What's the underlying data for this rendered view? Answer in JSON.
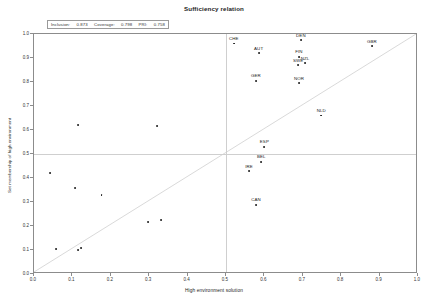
{
  "chart_data": {
    "type": "scatter",
    "title": "Sufficiency relation",
    "xlabel": "High environment solution",
    "ylabel": "Set membership of high environment",
    "xlim": [
      0.0,
      1.0
    ],
    "ylim": [
      0.0,
      1.0
    ],
    "grid": false,
    "legend_position": "none",
    "xticks": [
      "0.0",
      "0.1",
      "0.2",
      "0.3",
      "0.4",
      "0.5",
      "0.6",
      "0.7",
      "0.8",
      "0.9",
      "1.0"
    ],
    "yticks": [
      "0.0",
      "0.1",
      "0.2",
      "0.3",
      "0.4",
      "0.5",
      "0.6",
      "0.7",
      "0.8",
      "0.9",
      "1.0"
    ],
    "xtick_values": [
      0.0,
      0.1,
      0.2,
      0.3,
      0.4,
      0.5,
      0.6,
      0.7,
      0.8,
      0.9,
      1.0
    ],
    "ytick_values": [
      0.0,
      0.1,
      0.2,
      0.3,
      0.4,
      0.5,
      0.6,
      0.7,
      0.8,
      0.9,
      1.0
    ],
    "reference_lines": [
      {
        "name": "diagonal",
        "type": "diagonal",
        "from": [
          0.0,
          0.0
        ],
        "to": [
          1.0,
          1.0
        ],
        "color": "#cfcfcf"
      },
      {
        "name": "vertical-threshold",
        "type": "vertical",
        "value": 0.5,
        "color": "#cfcfcf"
      },
      {
        "name": "horizontal-threshold",
        "type": "horizontal",
        "value": 0.5,
        "color": "#cfcfcf"
      }
    ],
    "point_color": "#1a1a1a",
    "points": [
      {
        "label": "CHE",
        "x": 0.52,
        "y": 0.96
      },
      {
        "label": "AUT",
        "x": 0.585,
        "y": 0.92
      },
      {
        "label": "DEN",
        "x": 0.695,
        "y": 0.975
      },
      {
        "label": "GBR",
        "x": 0.88,
        "y": 0.95
      },
      {
        "label": "FIN",
        "x": 0.69,
        "y": 0.905
      },
      {
        "label": "SWE",
        "x": 0.688,
        "y": 0.87
      },
      {
        "label": "NZL",
        "x": 0.706,
        "y": 0.878
      },
      {
        "label": "GER",
        "x": 0.578,
        "y": 0.805
      },
      {
        "label": "NOR",
        "x": 0.69,
        "y": 0.795
      },
      {
        "label": "NLD",
        "x": 0.748,
        "y": 0.66
      },
      {
        "label": "ESP",
        "x": 0.6,
        "y": 0.53
      },
      {
        "label": "BEL",
        "x": 0.592,
        "y": 0.468
      },
      {
        "label": "IRE",
        "x": 0.56,
        "y": 0.428
      },
      {
        "label": "CAN",
        "x": 0.578,
        "y": 0.288
      },
      {
        "label": "",
        "x": 0.115,
        "y": 0.62
      },
      {
        "label": "",
        "x": 0.32,
        "y": 0.618
      },
      {
        "label": "",
        "x": 0.042,
        "y": 0.42
      },
      {
        "label": "",
        "x": 0.107,
        "y": 0.358
      },
      {
        "label": "",
        "x": 0.176,
        "y": 0.33
      },
      {
        "label": "",
        "x": 0.298,
        "y": 0.218
      },
      {
        "label": "",
        "x": 0.33,
        "y": 0.225
      },
      {
        "label": "",
        "x": 0.058,
        "y": 0.105
      },
      {
        "label": "",
        "x": 0.115,
        "y": 0.1
      },
      {
        "label": "",
        "x": 0.122,
        "y": 0.108
      }
    ]
  },
  "stats": {
    "inclusion_label": "Inclusion:",
    "inclusion_value": "0.873",
    "coverage_label": "Coverage:",
    "coverage_value": "0.798",
    "pri_label": "PRI:",
    "pri_value": "0.758"
  }
}
